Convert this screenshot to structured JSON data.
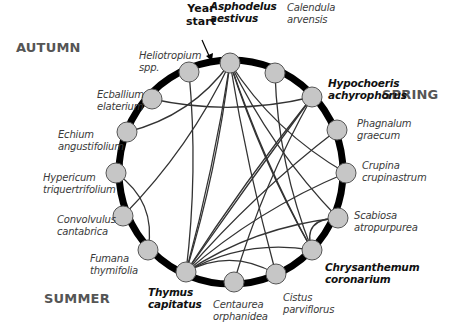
{
  "diagram": {
    "annotation": "Year\nstart",
    "seasons": [
      {
        "label": "AUTUMN",
        "x": 16,
        "y": 40
      },
      {
        "label": "SPRING",
        "x": 382,
        "y": 87
      },
      {
        "label": "SUMMER",
        "x": 44,
        "y": 291
      }
    ],
    "ring": {
      "cx": 231,
      "cy": 172,
      "r": 112,
      "color": "#000000",
      "width": 7
    },
    "node_style": {
      "fill": "#c6c6c6",
      "stroke": "#555555",
      "r": 10
    },
    "nodes": [
      {
        "id": "asphodelus",
        "label": "Asphodelus\naestivus",
        "bold": true,
        "x": 230,
        "y": 63,
        "lx": 210,
        "ly": 0,
        "align": "left"
      },
      {
        "id": "calendula",
        "label": "Calendula\narvensis",
        "bold": false,
        "x": 275,
        "y": 73,
        "lx": 287,
        "ly": 2
      },
      {
        "id": "hypochoeris",
        "label": "Hypochoeris\nachyrophorus",
        "bold": true,
        "x": 312,
        "y": 97,
        "lx": 328,
        "ly": 77
      },
      {
        "id": "phagnalum",
        "label": "Phagnalum\ngraecum",
        "bold": false,
        "x": 337,
        "y": 130,
        "lx": 357,
        "ly": 118
      },
      {
        "id": "crupina",
        "label": "Crupina\ncrupinastrum",
        "bold": false,
        "x": 346,
        "y": 173,
        "lx": 362,
        "ly": 160
      },
      {
        "id": "scabiosa",
        "label": "Scabiosa\natropurpurea",
        "bold": false,
        "x": 338,
        "y": 218,
        "lx": 354,
        "ly": 210
      },
      {
        "id": "chrysanthemum",
        "label": "Chrysanthemum\ncoronarium",
        "bold": true,
        "x": 312,
        "y": 250,
        "lx": 325,
        "ly": 261
      },
      {
        "id": "cistus",
        "label": "Cistus\nparviflorus",
        "bold": false,
        "x": 276,
        "y": 274,
        "lx": 283,
        "ly": 292
      },
      {
        "id": "centaurea",
        "label": "Centaurea\norphanidea",
        "bold": false,
        "x": 234,
        "y": 282,
        "lx": 213,
        "ly": 299
      },
      {
        "id": "thymus",
        "label": "Thymus\ncapitatus",
        "bold": true,
        "x": 186,
        "y": 272,
        "lx": 148,
        "ly": 286
      },
      {
        "id": "fumana",
        "label": "Fumana\nthymifolia",
        "bold": false,
        "x": 148,
        "y": 250,
        "lx": 90,
        "ly": 253
      },
      {
        "id": "convolvulus",
        "label": "Convolvulus\ncantabrica",
        "bold": false,
        "x": 123,
        "y": 216,
        "lx": 57,
        "ly": 214
      },
      {
        "id": "hypericum",
        "label": "Hypericum\ntriquertrifolium",
        "bold": false,
        "x": 116,
        "y": 173,
        "lx": 43,
        "ly": 172
      },
      {
        "id": "echium",
        "label": "Echium\nangustifolium",
        "bold": false,
        "x": 127,
        "y": 132,
        "lx": 58,
        "ly": 129
      },
      {
        "id": "ecballium",
        "label": "Ecballium\nelaterium",
        "bold": false,
        "x": 152,
        "y": 99,
        "lx": 97,
        "ly": 89
      },
      {
        "id": "heliotropium",
        "label": "Heliotropium\nspp.",
        "bold": false,
        "x": 189,
        "y": 72,
        "lx": 139,
        "ly": 50
      }
    ],
    "edges": [
      [
        "asphodelus",
        "thymus"
      ],
      [
        "asphodelus",
        "thymus"
      ],
      [
        "asphodelus",
        "chrysanthemum"
      ],
      [
        "asphodelus",
        "chrysanthemum"
      ],
      [
        "asphodelus",
        "crupina"
      ],
      [
        "asphodelus",
        "scabiosa"
      ],
      [
        "asphodelus",
        "cistus"
      ],
      [
        "asphodelus",
        "echium"
      ],
      [
        "calendula",
        "chrysanthemum"
      ],
      [
        "hypochoeris",
        "thymus"
      ],
      [
        "hypochoeris",
        "thymus"
      ],
      [
        "hypochoeris",
        "ecballium"
      ],
      [
        "hypochoeris",
        "centaurea"
      ],
      [
        "phagnalum",
        "thymus"
      ],
      [
        "crupina",
        "thymus"
      ],
      [
        "scabiosa",
        "thymus"
      ],
      [
        "chrysanthemum",
        "thymus"
      ],
      [
        "cistus",
        "thymus"
      ],
      [
        "heliotropium",
        "thymus"
      ],
      [
        "hypericum",
        "fumana"
      ],
      [
        "convolvulus",
        "asphodelus"
      ],
      [
        "chrysanthemum",
        "scabiosa"
      ]
    ]
  }
}
